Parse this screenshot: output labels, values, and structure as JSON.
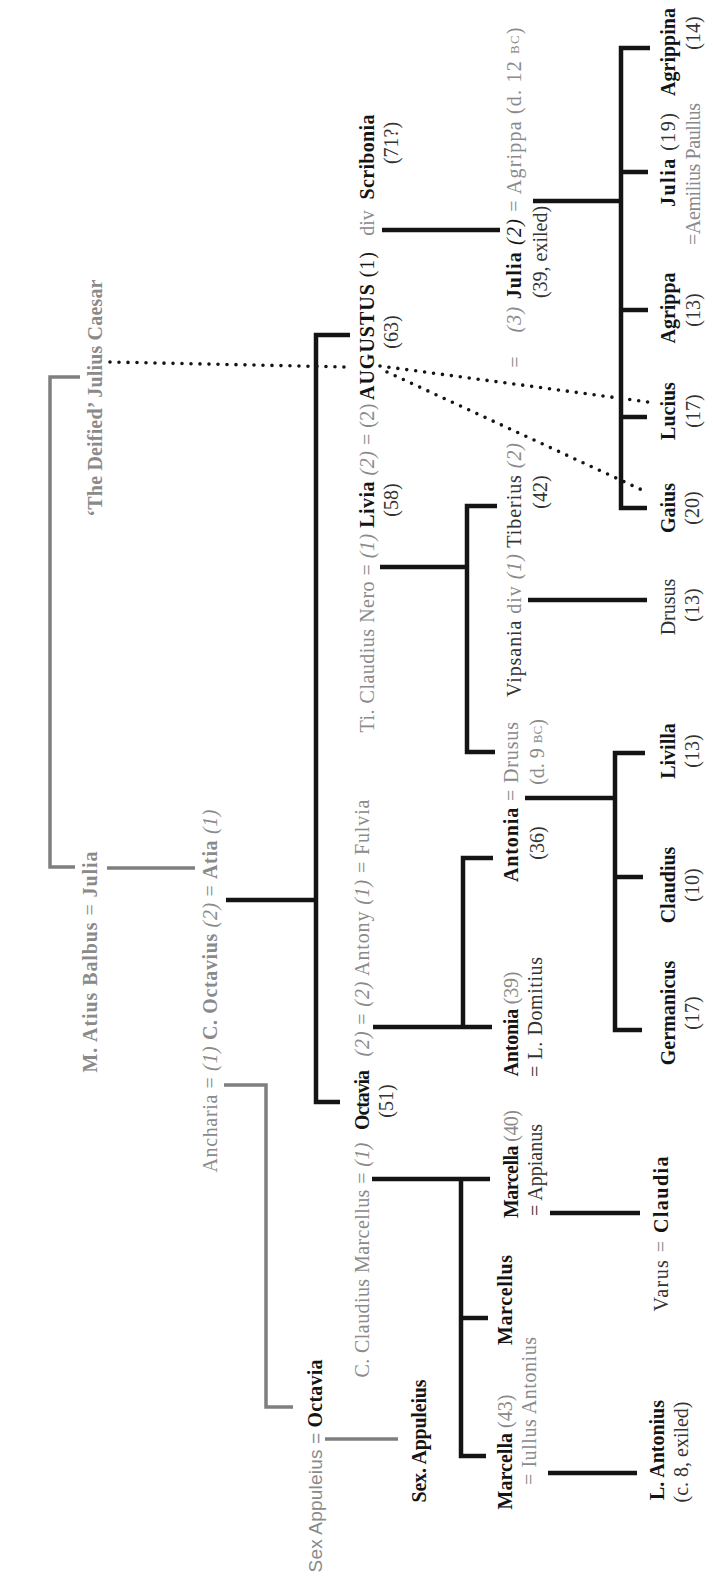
{
  "colors": {
    "ink": "#141414",
    "dark_text": "#333333",
    "gray_text": "#8a8a8a",
    "gray_line": "#7f7f7f",
    "background": "#ffffff"
  },
  "generation_1": {
    "julius_caesar": "‘The Deified’ Julius Caesar",
    "balbus_marriage": {
      "husband": "M. Atius Balbus",
      "symbol": "=",
      "wife": "Julia"
    }
  },
  "generation_2": {
    "octavius_marriages": {
      "first_wife": "Ancharia",
      "symbol_1": "=",
      "order_1": "(1)",
      "husband": "C. Octavius",
      "order_2": "(2)",
      "symbol_2": "=",
      "second_wife": "Atia",
      "order_3": "(1)"
    }
  },
  "generation_3": {
    "livia_augustus": {
      "nero": "Ti. Claudius Nero",
      "symbol_1": "=",
      "order_1": "(1)",
      "livia": "Livia",
      "livia_age": "(58)",
      "order_2": "(2)",
      "symbol_2": "=",
      "order_3": "(2)",
      "augustus": "AUGUSTUS",
      "augustus_age": "(63)",
      "order_4": "(1)",
      "divorce": "div",
      "scribonia": "Scribonia",
      "scribonia_age": "(71?)"
    },
    "octavia_marriages": {
      "marcellus": "C. Claudius Marcellus",
      "symbol_1": "=",
      "order_1": "(1)",
      "octavia": "Octavia",
      "octavia_age": "(51)",
      "order_2": "(2)",
      "symbol_2": "=",
      "order_3": "(2)",
      "antony": "Antony",
      "order_4": "(1)",
      "symbol_3": "=",
      "fulvia": "Fulvia"
    },
    "appuleius_marriage": {
      "husband": "Sex Appuleius",
      "symbol": "=",
      "wife": "Octavia"
    }
  },
  "generation_4": {
    "julia": {
      "order_1": "(3)",
      "name": "Julia",
      "order_2": "(2)",
      "symbol": "=",
      "spouse": "Agrippa",
      "spouse_death": "(d. 12",
      "spouse_death_era": "BC",
      "spouse_death_close": ")",
      "note": "(39, exiled)",
      "tiberius_symbol": "="
    },
    "tiberius": {
      "first_wife": "Vipsania",
      "divorce": "div",
      "order_1": "(1)",
      "name": "Tiberius",
      "order_2": "(2)",
      "age": "(42)"
    },
    "antonia_minor": {
      "name": "Antonia",
      "age": "(36)",
      "symbol": "=",
      "spouse": "Drusus",
      "spouse_death": "(d. 9",
      "spouse_death_era": "BC",
      "spouse_death_close": ")"
    },
    "antonia_major": {
      "name": "Antonia",
      "age": "(39)",
      "spouse": "= L. Domitius"
    },
    "marcella_major": {
      "name": "Marcella",
      "age": "(40)",
      "spouse": "= Appianus"
    },
    "marcellus": {
      "name": "Marcellus"
    },
    "marcella_minor": {
      "name": "Marcella",
      "age": "(43)",
      "spouse": "= Iullus Antonius"
    },
    "sex_appuleius": {
      "name": "Sex. Appuleius"
    }
  },
  "generation_5": {
    "agrippina": {
      "name": "Agrippina",
      "age": "(14)"
    },
    "julia_younger": {
      "name": "Julia",
      "age": "(19)",
      "spouse": "=Aemilius Paullus"
    },
    "agrippa_postumus": {
      "name": "Agrippa",
      "age": "(13)"
    },
    "lucius": {
      "name": "Lucius",
      "age": "(17)"
    },
    "gaius": {
      "name": "Gaius",
      "age": "(20)"
    },
    "drusus": {
      "name": "Drusus",
      "age": "(13)"
    },
    "livilla": {
      "name": "Livilla",
      "age": "(13)"
    },
    "claudius": {
      "name": "Claudius",
      "age": "(10)"
    },
    "germanicus": {
      "name": "Germanicus",
      "age": "(17)"
    },
    "claudia": {
      "spouse": "Varus",
      "symbol": "=",
      "name": "Claudia"
    },
    "l_antonius": {
      "name": "L. Antonius",
      "note": "(c. 8, exiled)"
    }
  }
}
